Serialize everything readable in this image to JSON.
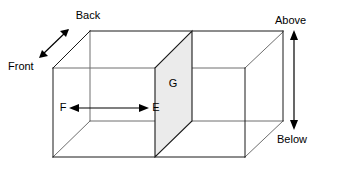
{
  "diagram": {
    "background_color": "#ffffff",
    "line_color": "#1a1a1a",
    "hidden_line_color": "#6e6e6e",
    "partition_fill_color": "#ebebeb",
    "text_color": "#000000",
    "labels": {
      "back": "Back",
      "front": "Front",
      "above": "Above",
      "below": "Below",
      "left_interior": "F",
      "right_interior": "E",
      "partition": "G"
    },
    "arrows": {
      "depth_axis": {
        "name": "front-back-arrow",
        "from_label": "Front",
        "to_label": "Back",
        "orientation": "diagonal",
        "double_headed": true
      },
      "vertical_axis": {
        "name": "above-below-arrow",
        "from_label": "Above",
        "to_label": "Below",
        "orientation": "vertical",
        "double_headed": true
      },
      "horizontal_interior": {
        "name": "f-e-arrow",
        "from_label": "F",
        "to_label": "E",
        "orientation": "horizontal",
        "double_headed": true
      }
    }
  }
}
